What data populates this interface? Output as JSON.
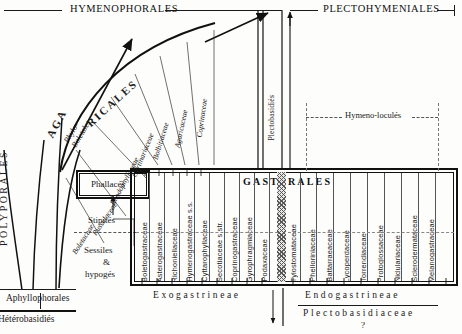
{
  "figure": {
    "title_top_left": "HYMENOPHORALES",
    "title_top_right": "PLECTOHYMENIALES",
    "center_title": "GASTERALES",
    "hymeno_locules": "Hymeno-loculés",
    "plectobasidies": "Plectobasidiés"
  },
  "left_axis": {
    "polyporales": "POLYPORALES",
    "agaricales": "AGA",
    "agaricales_cont": "RICALES",
    "phylo_boletales": "Phylo-Boletales",
    "aphyllophorales": "Aphyllophorales",
    "heterobasidies": "Hétérobasidiés"
  },
  "habit": {
    "phallaces": "Phallacés",
    "stipites": "Stipités",
    "sessiles": "Sessiles",
    "amp": "&",
    "hypoges": "hypogés"
  },
  "arc_families": [
    {
      "label": "Boletaceae"
    },
    {
      "label": "Russulaceae"
    },
    {
      "label": "Rhodophyllaceae"
    },
    {
      "label": "Cortinariaceae"
    },
    {
      "label": "Bolbitiaceae"
    },
    {
      "label": "Agaricaceae"
    },
    {
      "label": "Coprinaceae"
    }
  ],
  "exogastrineae": {
    "label": "Exogastrineae",
    "families": [
      "Boletogastraceae",
      "Asterogastraceae",
      "Richoniellaceae",
      "Hymenogastraceae s.s.",
      "Cyttarophyllaceae",
      "Secotiaceae s.str.",
      "Coprinogastraceae",
      "Gyrophragmiaceae",
      "Podaxaceae"
    ]
  },
  "transition": {
    "families": [
      "Tylostomataceae"
    ]
  },
  "endogastrineae": {
    "label": "Endogastrineae",
    "sublabel": "Plectobasidiaceae",
    "query": "?",
    "families": [
      "Phelloriniaceae",
      "Battarraeaceae",
      "Lycoperdaceae",
      "Torrendiaceae",
      "Protoglossaceae",
      "Nidulariaceae",
      "Sclerodermataceae",
      "Melanogastraceae"
    ]
  },
  "colors": {
    "ink": "#1a1a1a",
    "paper": "#fdfdfb",
    "dash": "#777777",
    "hatch": "#777777"
  }
}
